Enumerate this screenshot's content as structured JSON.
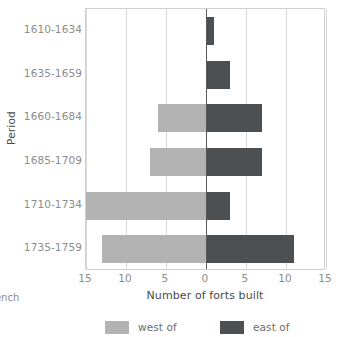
{
  "chart_data": {
    "type": "bar",
    "orientation": "horizontal",
    "layout": "diverging",
    "title": "",
    "xlabel": "Number of forts built",
    "ylabel": "Period",
    "categories": [
      "1610-1634",
      "1635-1659",
      "1660-1684",
      "1685-1709",
      "1710-1734",
      "1735-1759"
    ],
    "series": [
      {
        "name": "west of",
        "color": "#b3b3b3",
        "direction": "left",
        "values": [
          0,
          0,
          6,
          7,
          15,
          13
        ]
      },
      {
        "name": "east of",
        "color": "#4d5053",
        "direction": "right",
        "values": [
          1,
          3,
          7,
          7,
          3,
          11
        ]
      }
    ],
    "xlim": [
      -15,
      15
    ],
    "xticks": [
      -15,
      -10,
      -5,
      0,
      5,
      10,
      15
    ],
    "xtick_labels": [
      "15",
      "10",
      "5",
      "0",
      "5",
      "10",
      "15"
    ],
    "grid": "vertical",
    "zero_line": true,
    "legend_position": "bottom"
  },
  "axes": {
    "y_title": "Period",
    "x_title": "Number of forts built",
    "y_tick_labels": [
      "1610-1634",
      "1635-1659",
      "1660-1684",
      "1685-1709",
      "1710-1734",
      "1735-1759"
    ],
    "x_tick_labels": [
      "15",
      "10",
      "5",
      "0",
      "5",
      "10",
      "15"
    ]
  },
  "legend": {
    "entries": [
      {
        "label": "west of",
        "color": "#b3b3b3"
      },
      {
        "label": "east of",
        "color": "#4d5053"
      }
    ]
  },
  "caption": {
    "line1": "French",
    "line2": "e",
    "line3": "..."
  },
  "colors": {
    "west": "#b3b3b3",
    "east": "#4d5053",
    "gridline": "#d8d8d8",
    "zero_line": "#5a5a5a",
    "frame": "#cfcfcf",
    "tick_text": "#8c8c8c",
    "axis_title_text": "#4a4a4a"
  }
}
